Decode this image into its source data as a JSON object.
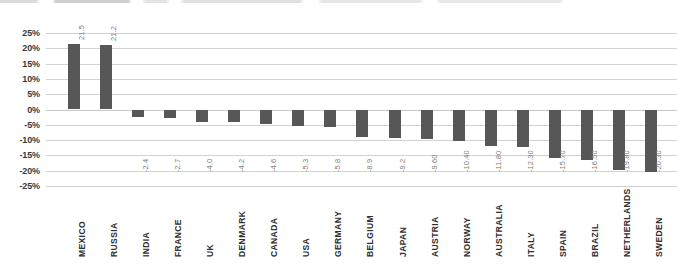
{
  "chart_data": {
    "type": "bar",
    "title": "",
    "subtitle": "",
    "xlabel": "",
    "ylabel": "",
    "ylim": [
      -25,
      25
    ],
    "ytick_labels": [
      "25%",
      "20%",
      "15%",
      "10%",
      "5%",
      "0%",
      "-5%",
      "-10%",
      "-15%",
      "-20%",
      "-25%"
    ],
    "ytick_values": [
      25,
      20,
      15,
      10,
      5,
      0,
      -5,
      -10,
      -15,
      -20,
      -25
    ],
    "grid": true,
    "legend": "none",
    "orientation": "vertical",
    "value_label_format": "mixed-decimal",
    "bar_color": "#575757",
    "gridline_color": "#d2d2d2",
    "categories": [
      "MEXICO",
      "RUSSIA",
      "INDIA",
      "FRANCE",
      "UK",
      "DENMARK",
      "CANADA",
      "USA",
      "GERMANY",
      "BELGIUM",
      "JAPAN",
      "AUSTRIA",
      "NORWAY",
      "AUSTRALIA",
      "ITALY",
      "SPAIN",
      "BRAZIL",
      "NETHERLANDS",
      "SWEDEN"
    ],
    "values": [
      21.5,
      21.2,
      -2.4,
      -2.7,
      -4.0,
      -4.2,
      -4.6,
      -5.3,
      -5.8,
      -8.9,
      -9.2,
      -9.6,
      -10.4,
      -11.8,
      -12.3,
      -15.7,
      -16.5,
      -19.8,
      -20.3
    ],
    "value_labels": [
      "21.5",
      "21.2",
      "-2.4",
      "-2.7",
      "-4.0",
      "-4.2",
      "-4.6",
      "-5.3",
      "-5.8",
      "-8.9",
      "-9.2",
      "-9.60",
      "-10.40",
      "-11.80",
      "-12.30",
      "-15.70",
      "-16.50",
      "-19.80",
      "-20.30"
    ]
  }
}
